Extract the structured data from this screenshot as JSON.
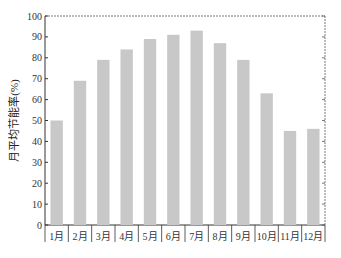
{
  "chart_data": {
    "type": "bar",
    "title": "",
    "xlabel": "",
    "ylabel": "月平均节能率(%)",
    "categories": [
      "1月",
      "2月",
      "3月",
      "4月",
      "5月",
      "6月",
      "7月",
      "8月",
      "9月",
      "10月",
      "11月",
      "12月"
    ],
    "values": [
      50,
      69,
      79,
      84,
      89,
      91,
      93,
      87,
      79,
      63,
      45,
      46
    ],
    "ylim": [
      0,
      100
    ],
    "yticks": [
      0,
      10,
      20,
      30,
      40,
      50,
      60,
      70,
      80,
      90,
      100
    ],
    "grid": false,
    "legend": "none",
    "bar_color": "#c8c8c8",
    "axis_color": "#333333"
  }
}
